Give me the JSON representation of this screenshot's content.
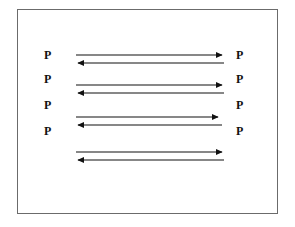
{
  "figure": {
    "type": "diagram",
    "background_color": "#ffffff",
    "frame": {
      "border_color": "#6b6b6b",
      "fill_color": "#ffffff",
      "x": 17,
      "y": 9,
      "width": 261,
      "height": 205
    },
    "stroke_color": "#111111",
    "left_labels": [
      {
        "text": "P",
        "x": 44,
        "y": 55
      },
      {
        "text": "P",
        "x": 44,
        "y": 79
      },
      {
        "text": "P",
        "x": 44,
        "y": 105
      },
      {
        "text": "P",
        "x": 44,
        "y": 131
      }
    ],
    "right_labels": [
      {
        "text": "P",
        "x": 236,
        "y": 55
      },
      {
        "text": "P",
        "x": 236,
        "y": 79
      },
      {
        "text": "P",
        "x": 236,
        "y": 105
      },
      {
        "text": "P",
        "x": 236,
        "y": 131
      }
    ],
    "arrow_pairs": [
      {
        "name": "arrow-pair-1",
        "right_arrow": {
          "x1": 76,
          "x2": 224,
          "y": 55,
          "direction": "right"
        },
        "left_arrow": {
          "x1": 224,
          "x2": 76,
          "y": 63,
          "direction": "left"
        }
      },
      {
        "name": "arrow-pair-2",
        "right_arrow": {
          "x1": 76,
          "x2": 224,
          "y": 85,
          "direction": "right"
        },
        "left_arrow": {
          "x1": 224,
          "x2": 76,
          "y": 93,
          "direction": "left"
        }
      },
      {
        "name": "arrow-pair-3",
        "right_arrow": {
          "x1": 76,
          "x2": 220,
          "y": 117,
          "direction": "right"
        },
        "left_arrow": {
          "x1": 222,
          "x2": 76,
          "y": 125,
          "direction": "left"
        }
      },
      {
        "name": "arrow-pair-4",
        "right_arrow": {
          "x1": 76,
          "x2": 224,
          "y": 152,
          "direction": "right"
        },
        "left_arrow": {
          "x1": 224,
          "x2": 76,
          "y": 160,
          "direction": "left"
        }
      }
    ]
  }
}
